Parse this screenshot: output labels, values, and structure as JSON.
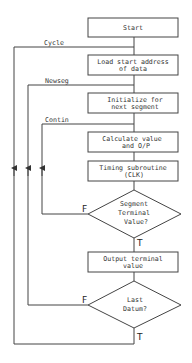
{
  "flowchart": {
    "nodes": {
      "start": {
        "line1": "Start"
      },
      "load": {
        "line1": "Load start address",
        "line2": "of data"
      },
      "init": {
        "line1": "Initialize for",
        "line2": "next segment"
      },
      "calc": {
        "line1": "Calculate value",
        "line2": "and O/P"
      },
      "timing": {
        "line1": "Timing subroutine",
        "line2": "(CLK)"
      },
      "segment_decision": {
        "line1": "Segment",
        "line2": "Terminal",
        "line3": "Value?"
      },
      "output": {
        "line1": "Output terminal",
        "line2": "value"
      },
      "last_decision": {
        "line1": "Last",
        "line2": "Datum?"
      }
    },
    "loop_labels": {
      "cycle": "Cycle",
      "newseg": "Newseg",
      "contin": "Contin"
    },
    "branch_labels": {
      "segment_false": "F",
      "segment_true": "T",
      "last_false": "F",
      "last_true": "T"
    }
  }
}
